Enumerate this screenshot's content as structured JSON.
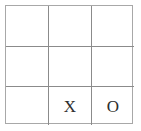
{
  "board": {
    "title": "Tic-tac-toe board",
    "rows": 3,
    "columns": 3,
    "empty_label": "",
    "colors": {
      "background": "#ffffff",
      "outer_border": "#a8a8a8",
      "grid_line": "#8b8b8b",
      "mark": "#2e2e2e"
    },
    "cells": [
      {
        "row": 0,
        "col": 0,
        "mark": ""
      },
      {
        "row": 0,
        "col": 1,
        "mark": ""
      },
      {
        "row": 0,
        "col": 2,
        "mark": ""
      },
      {
        "row": 1,
        "col": 0,
        "mark": ""
      },
      {
        "row": 1,
        "col": 1,
        "mark": ""
      },
      {
        "row": 1,
        "col": 2,
        "mark": ""
      },
      {
        "row": 2,
        "col": 0,
        "mark": ""
      },
      {
        "row": 2,
        "col": 1,
        "mark": "X"
      },
      {
        "row": 2,
        "col": 2,
        "mark": "O"
      }
    ]
  }
}
